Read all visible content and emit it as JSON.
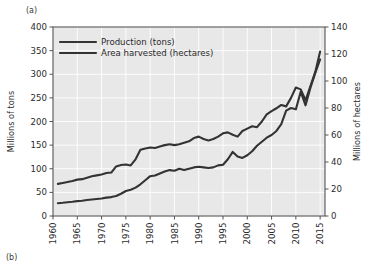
{
  "figure": {
    "panel_a_label": "(a)",
    "panel_b_label": "(b)"
  },
  "chart_data": {
    "type": "line",
    "title": "",
    "xlabel": "",
    "ylabel": "Millions of  tons",
    "y2label": "Millions of hectares",
    "xlim": [
      1960,
      2016
    ],
    "ylim": [
      0,
      400
    ],
    "y2lim": [
      0,
      140
    ],
    "xticks": [
      1960,
      1965,
      1970,
      1975,
      1980,
      1985,
      1990,
      1995,
      2000,
      2005,
      2010,
      2015
    ],
    "xticklabels": [
      "1960",
      "1965",
      "1970",
      "1975",
      "1980",
      "1985",
      "1990",
      "1995",
      "2000",
      "2005",
      "2010",
      "2015"
    ],
    "yticks": [
      0,
      50,
      100,
      150,
      200,
      250,
      300,
      350,
      400
    ],
    "yticklabels": [
      "0",
      "50",
      "100",
      "150",
      "200",
      "250",
      "300",
      "350",
      "400"
    ],
    "y2ticks": [
      0,
      20,
      40,
      60,
      80,
      100,
      120,
      140
    ],
    "y2ticklabels": [
      "0",
      "20",
      "40",
      "60",
      "80",
      "100",
      "120",
      "140"
    ],
    "grid": true,
    "legend_position": "upper-left",
    "plot_bg": "#e8e8e8",
    "grid_color": "#ffffff",
    "line_color": "#333333",
    "x": [
      1961,
      1962,
      1963,
      1964,
      1965,
      1966,
      1967,
      1968,
      1969,
      1970,
      1971,
      1972,
      1973,
      1974,
      1975,
      1976,
      1977,
      1978,
      1979,
      1980,
      1981,
      1982,
      1983,
      1984,
      1985,
      1986,
      1987,
      1988,
      1989,
      1990,
      1991,
      1992,
      1993,
      1994,
      1995,
      1996,
      1997,
      1998,
      1999,
      2000,
      2001,
      2002,
      2003,
      2004,
      2005,
      2006,
      2007,
      2008,
      2009,
      2010,
      2011,
      2012,
      2013,
      2014,
      2015
    ],
    "series": [
      {
        "name": "Production (tons)",
        "axis": "left",
        "unit": "millions of tons",
        "values": [
          68,
          70,
          72,
          74,
          77,
          78,
          81,
          84,
          86,
          88,
          91,
          92,
          105,
          108,
          109,
          107,
          120,
          140,
          143,
          145,
          144,
          147,
          150,
          152,
          150,
          152,
          155,
          158,
          165,
          168,
          163,
          160,
          163,
          168,
          175,
          177,
          172,
          168,
          180,
          185,
          190,
          188,
          200,
          215,
          222,
          228,
          235,
          232,
          250,
          272,
          268,
          245,
          275,
          305,
          348
        ]
      },
      {
        "name": "Area harvested (hectares)",
        "axis": "right",
        "unit": "millions of hectares",
        "values": [
          9.5,
          9.8,
          10.2,
          10.5,
          11.0,
          11.3,
          11.8,
          12.2,
          12.6,
          13.0,
          13.6,
          14.0,
          14.8,
          16.5,
          18.5,
          19.5,
          21.0,
          23.5,
          26.5,
          29.5,
          30.0,
          31.5,
          33.0,
          34.0,
          33.5,
          35.0,
          34.0,
          35.0,
          36.0,
          36.5,
          36.0,
          35.5,
          36.0,
          37.5,
          38.0,
          42.0,
          47.5,
          44.0,
          43.0,
          45.0,
          48.0,
          52.0,
          55.0,
          58.0,
          60.0,
          63.0,
          68.0,
          78.0,
          80.0,
          79.0,
          92.0,
          82.0,
          95.0,
          106.0,
          116.0
        ]
      }
    ],
    "legend": [
      "Production (tons)",
      "Area harvested (hectares)"
    ]
  }
}
